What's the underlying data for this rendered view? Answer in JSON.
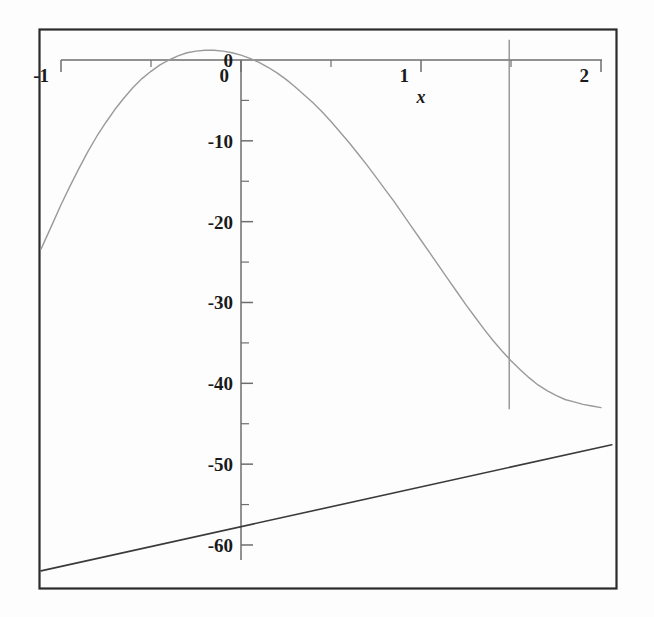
{
  "chart_data": {
    "type": "line",
    "title": "",
    "subtitle": "",
    "xlabel": "x",
    "ylabel": "",
    "xlim": [
      -1.12,
      2.08
    ],
    "ylim": [
      -64.5,
      2.5
    ],
    "grid": false,
    "legend": null,
    "x_ticks_major": [
      -1,
      0,
      1,
      2
    ],
    "x_tick_labels": [
      "-1",
      "0",
      "1",
      "2"
    ],
    "x_ticks_minor": [
      -0.5,
      0.5,
      1.5
    ],
    "y_ticks_major": [
      0,
      -10,
      -20,
      -30,
      -40,
      -50,
      -60
    ],
    "y_tick_labels": [
      "0",
      "-10",
      "-20",
      "-30",
      "-40",
      "-50",
      "-60"
    ],
    "y_ticks_minor": [
      -5,
      -15,
      -25,
      -35,
      -45,
      -55
    ],
    "axis_position": "top-and-left-of-origin",
    "series": [
      {
        "name": "curve",
        "type": "line",
        "color": "#9a9a9a",
        "width": 1.4,
        "points": [
          [
            -1.12,
            -23.4
          ],
          [
            -1.05,
            -20.4
          ],
          [
            -1.0,
            -17.9
          ],
          [
            -0.95,
            -15.6
          ],
          [
            -0.9,
            -13.4
          ],
          [
            -0.85,
            -11.3
          ],
          [
            -0.8,
            -9.4
          ],
          [
            -0.75,
            -7.7
          ],
          [
            -0.7,
            -6.1
          ],
          [
            -0.65,
            -4.7
          ],
          [
            -0.6,
            -3.4
          ],
          [
            -0.55,
            -2.3
          ],
          [
            -0.5,
            -1.4
          ],
          [
            -0.45,
            -0.6
          ],
          [
            -0.4,
            0.0
          ],
          [
            -0.35,
            0.5
          ],
          [
            -0.3,
            0.9
          ],
          [
            -0.25,
            1.1
          ],
          [
            -0.2,
            1.2
          ],
          [
            -0.15,
            1.2
          ],
          [
            -0.1,
            1.1
          ],
          [
            -0.05,
            0.9
          ],
          [
            0.0,
            0.6
          ],
          [
            0.05,
            0.2
          ],
          [
            0.1,
            -0.3
          ],
          [
            0.15,
            -0.9
          ],
          [
            0.2,
            -1.6
          ],
          [
            0.25,
            -2.4
          ],
          [
            0.3,
            -3.3
          ],
          [
            0.35,
            -4.3
          ],
          [
            0.4,
            -5.3
          ],
          [
            0.45,
            -6.4
          ],
          [
            0.5,
            -7.6
          ],
          [
            0.55,
            -8.9
          ],
          [
            0.6,
            -10.2
          ],
          [
            0.65,
            -11.6
          ],
          [
            0.7,
            -13.0
          ],
          [
            0.75,
            -14.5
          ],
          [
            0.8,
            -16.0
          ],
          [
            0.85,
            -17.5
          ],
          [
            0.9,
            -19.1
          ],
          [
            0.95,
            -20.7
          ],
          [
            1.0,
            -22.3
          ],
          [
            1.05,
            -23.9
          ],
          [
            1.1,
            -25.5
          ],
          [
            1.15,
            -27.1
          ],
          [
            1.2,
            -28.7
          ],
          [
            1.25,
            -30.3
          ],
          [
            1.3,
            -31.8
          ],
          [
            1.35,
            -33.3
          ],
          [
            1.4,
            -34.7
          ],
          [
            1.45,
            -36.0
          ],
          [
            1.5,
            -37.2
          ],
          [
            1.55,
            -38.3
          ],
          [
            1.6,
            -39.3
          ],
          [
            1.65,
            -40.2
          ],
          [
            1.7,
            -40.9
          ],
          [
            1.75,
            -41.5
          ],
          [
            1.8,
            -42.0
          ],
          [
            1.85,
            -42.3
          ],
          [
            1.9,
            -42.6
          ],
          [
            1.95,
            -42.8
          ],
          [
            2.0,
            -43.0
          ]
        ]
      },
      {
        "name": "tangent-line",
        "type": "line",
        "color": "#3a3a3a",
        "width": 1.6,
        "points": [
          [
            -1.12,
            -63.2
          ],
          [
            2.06,
            -47.6
          ]
        ]
      }
    ],
    "annotations": [
      {
        "name": "vertical-marker",
        "type": "vline",
        "x": 1.49,
        "y_from": 2.5,
        "y_to": -43.2,
        "color": "#8a8a8a"
      }
    ],
    "tangent_point": {
      "x": 1.49,
      "y": -43.2
    }
  },
  "labels": {
    "x_axis_name": "x",
    "x": {
      "t0": "-1",
      "t1": "0",
      "t2": "1",
      "t3": "2"
    },
    "y": {
      "t0": "0",
      "t1": "-10",
      "t2": "-20",
      "t3": "-30",
      "t4": "-40",
      "t5": "-50",
      "t6": "-60"
    }
  },
  "colors": {
    "frame": "#2b2b2b",
    "axis": "#6e6e6e",
    "curve": "#9a9a9a",
    "line": "#3a3a3a",
    "marker": "#8a8a8a",
    "background": "#fdfdfd"
  }
}
